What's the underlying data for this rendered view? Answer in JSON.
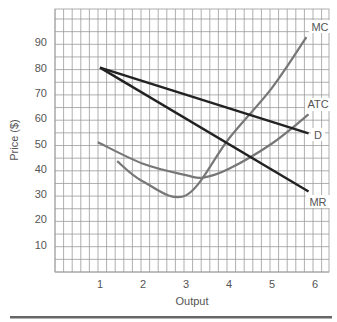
{
  "chart_data": {
    "type": "line",
    "title": "",
    "xlabel": "Output",
    "ylabel": "Price ($)",
    "x_ticks": [
      "1",
      "2",
      "3",
      "4",
      "5",
      "6"
    ],
    "y_ticks": [
      "10",
      "20",
      "30",
      "40",
      "50",
      "60",
      "70",
      "80",
      "90"
    ],
    "xlim": [
      0,
      6.4
    ],
    "ylim": [
      0,
      104
    ],
    "grid": true,
    "legend": "curve labels at line ends",
    "series": [
      {
        "name": "MC",
        "color": "#777777",
        "points": [
          [
            1.4,
            43
          ],
          [
            2,
            35
          ],
          [
            3,
            29.5
          ],
          [
            4,
            52
          ],
          [
            5,
            72
          ],
          [
            5.8,
            92
          ]
        ]
      },
      {
        "name": "ATC",
        "color": "#777777",
        "points": [
          [
            0.95,
            50.5
          ],
          [
            2,
            42
          ],
          [
            3,
            37.5
          ],
          [
            3.4,
            36.5
          ],
          [
            4,
            40
          ],
          [
            5,
            50
          ],
          [
            5.85,
            61.5
          ]
        ]
      },
      {
        "name": "D",
        "color": "#222222",
        "points": [
          [
            1,
            80
          ],
          [
            5.85,
            54
          ]
        ]
      },
      {
        "name": "MR",
        "color": "#222222",
        "points": [
          [
            1,
            80
          ],
          [
            5.85,
            31
          ]
        ]
      }
    ]
  }
}
